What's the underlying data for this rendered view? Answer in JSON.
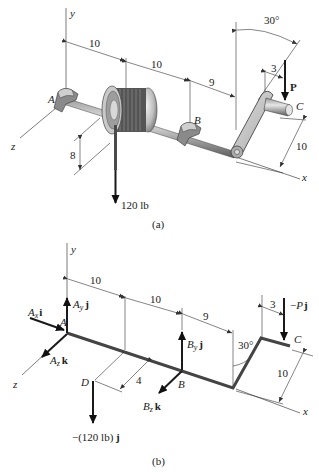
{
  "figure_a": {
    "caption": "(a)",
    "axes": {
      "x": "x",
      "y": "y",
      "z": "z"
    },
    "points": {
      "A": "A",
      "B": "B",
      "C": "C"
    },
    "dimensions": {
      "d1": "10",
      "d2": "10",
      "d3": "9",
      "d4": "3",
      "drum_radius": "8",
      "crank_length": "10",
      "angle": "30°"
    },
    "loads": {
      "weight": "120 lb",
      "force_P": "P"
    }
  },
  "figure_b": {
    "caption": "(b)",
    "axes": {
      "x": "x",
      "y": "y",
      "z": "z"
    },
    "points": {
      "A": "A",
      "B": "B",
      "C": "C",
      "D": "D"
    },
    "dimensions": {
      "d1": "10",
      "d2": "10",
      "d3": "9",
      "d4": "3",
      "offset": "4",
      "crank_length": "10",
      "angle": "30°"
    },
    "forces": {
      "Ax": {
        "sym": "A",
        "sub": "x",
        "unit": "i"
      },
      "Ay": {
        "sym": "A",
        "sub": "y",
        "unit": "j"
      },
      "Az": {
        "sym": "A",
        "sub": "z",
        "unit": "k"
      },
      "By": {
        "sym": "B",
        "sub": "y",
        "unit": "j"
      },
      "Bz": {
        "sym": "B",
        "sub": "z",
        "unit": "k"
      },
      "P": {
        "prefix": "−",
        "sym": "P",
        "unit": "j"
      },
      "W": {
        "text": "−(120 lb) ",
        "unit": "j"
      }
    }
  }
}
